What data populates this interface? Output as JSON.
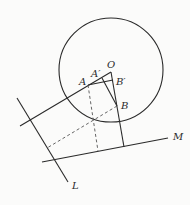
{
  "diagram": {
    "type": "geometry",
    "canvas": {
      "width": 190,
      "height": 205
    },
    "colors": {
      "stroke": "#2a2a2a",
      "dashed": "#555555",
      "background": "#fbfbfa"
    },
    "circle": {
      "center": [
        111,
        70
      ],
      "radius": 52
    },
    "points": {
      "O": {
        "label": "O",
        "x": 111,
        "y": 72
      },
      "A": {
        "label": "A",
        "x": 88,
        "y": 85
      },
      "A_prime": {
        "label": "A′",
        "x": 102,
        "y": 78
      },
      "B_prime": {
        "label": "B′",
        "x": 113,
        "y": 80
      },
      "B": {
        "label": "B",
        "x": 117,
        "y": 106
      }
    },
    "lines": {
      "L": {
        "label": "L",
        "from": [
          17,
          98
        ],
        "to": [
          68,
          182
        ]
      },
      "M": {
        "label": "M",
        "from": [
          42,
          162
        ],
        "to": [
          168,
          138
        ]
      }
    },
    "labels": {
      "O": "O",
      "A": "A",
      "A_prime": "A′",
      "B_prime": "B′",
      "B": "B",
      "L": "L",
      "M": "M"
    }
  }
}
